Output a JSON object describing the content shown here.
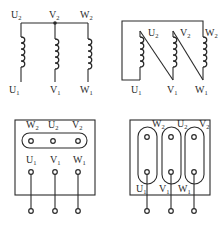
{
  "diagrams": {
    "star_windings": {
      "title": "Star (Y) connection windings",
      "top_labels": [
        "U2",
        "V2",
        "W2"
      ],
      "bottom_labels": [
        "U1",
        "V1",
        "W1"
      ]
    },
    "delta_windings": {
      "title": "Delta (triangle) connection windings",
      "top_labels": [
        "U2",
        "V2",
        "W2"
      ],
      "bottom_labels": [
        "U1",
        "V1",
        "W1"
      ]
    },
    "star_terminal_box": {
      "title": "Star connection terminal box",
      "top_row": [
        "W2",
        "U2",
        "V2"
      ],
      "bottom_row": [
        "U1",
        "V1",
        "W1"
      ]
    },
    "delta_terminal_box": {
      "title": "Delta connection terminal box",
      "top_row": [
        "W2",
        "U2",
        "V2"
      ],
      "bottom_row": [
        "U1",
        "V1",
        "W1"
      ]
    }
  },
  "colors": {
    "line": "#2a2a2a",
    "background": "#ffffff"
  }
}
